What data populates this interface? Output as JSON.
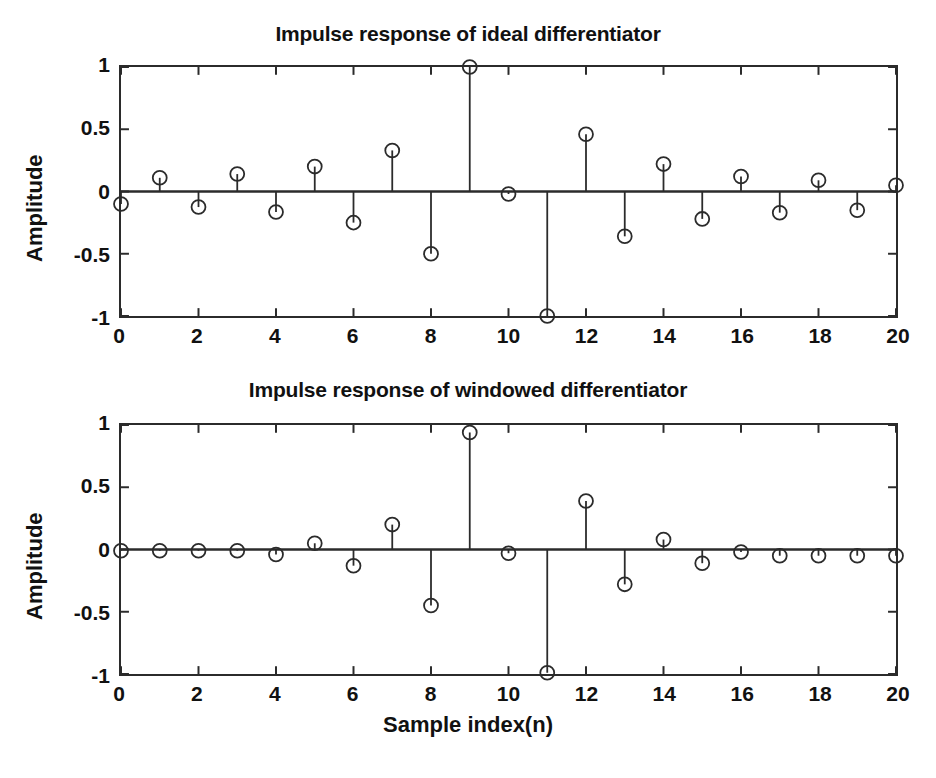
{
  "figure": {
    "background_color": "#ffffff",
    "line_color": "#2b2b2b",
    "marker_color": "#2b2b2b"
  },
  "panels": [
    {
      "id": "top",
      "title": "Impulse response of ideal differentiator",
      "ylabel": "Amplitude",
      "xlabel": "",
      "ytick_labels": [
        "1",
        "0.5",
        "0",
        "-0.5",
        "-1"
      ],
      "xtick_labels": [
        "0",
        "2",
        "4",
        "6",
        "8",
        "10",
        "12",
        "14",
        "16",
        "18",
        "20"
      ]
    },
    {
      "id": "bottom",
      "title": "Impulse response of windowed differentiator",
      "ylabel": "Amplitude",
      "xlabel": "Sample index(n)",
      "ytick_labels": [
        "1",
        "0.5",
        "0",
        "-0.5",
        "-1"
      ],
      "xtick_labels": [
        "0",
        "2",
        "4",
        "6",
        "8",
        "10",
        "12",
        "14",
        "16",
        "18",
        "20"
      ]
    }
  ],
  "chart_data": [
    {
      "type": "line",
      "subtype": "stem",
      "title": "Impulse response of ideal differentiator",
      "xlabel": "",
      "ylabel": "Amplitude",
      "xlim": [
        0,
        20
      ],
      "ylim": [
        -1,
        1
      ],
      "xticks": [
        0,
        2,
        4,
        6,
        8,
        10,
        12,
        14,
        16,
        18,
        20
      ],
      "yticks": [
        -1,
        -0.5,
        0,
        0.5,
        1
      ],
      "grid": false,
      "legend": null,
      "x": [
        0,
        1,
        2,
        3,
        4,
        5,
        6,
        7,
        8,
        9,
        10,
        11,
        12,
        13,
        14,
        15,
        16,
        17,
        18,
        19,
        20
      ],
      "values": [
        -0.1,
        0.11,
        -0.125,
        0.14,
        -0.165,
        0.2,
        -0.25,
        0.33,
        -0.5,
        1.0,
        -0.02,
        -1.0,
        0.46,
        -0.36,
        0.22,
        -0.22,
        0.12,
        -0.17,
        0.09,
        -0.15,
        0.05
      ],
      "marker": "circle-open",
      "baseline": 0
    },
    {
      "type": "line",
      "subtype": "stem",
      "title": "Impulse response of windowed differentiator",
      "xlabel": "Sample index(n)",
      "ylabel": "Amplitude",
      "xlim": [
        0,
        20
      ],
      "ylim": [
        -1,
        1
      ],
      "xticks": [
        0,
        2,
        4,
        6,
        8,
        10,
        12,
        14,
        16,
        18,
        20
      ],
      "yticks": [
        -1,
        -0.5,
        0,
        0.5,
        1
      ],
      "grid": false,
      "legend": null,
      "x": [
        0,
        1,
        2,
        3,
        4,
        5,
        6,
        7,
        8,
        9,
        10,
        11,
        12,
        13,
        14,
        15,
        16,
        17,
        18,
        19,
        20
      ],
      "values": [
        -0.01,
        -0.01,
        -0.01,
        -0.01,
        -0.04,
        0.05,
        -0.13,
        0.2,
        -0.45,
        0.94,
        -0.03,
        -0.99,
        0.39,
        -0.28,
        0.08,
        -0.11,
        -0.02,
        -0.05,
        -0.05,
        -0.05,
        -0.05
      ],
      "marker": "circle-open",
      "baseline": 0
    }
  ]
}
